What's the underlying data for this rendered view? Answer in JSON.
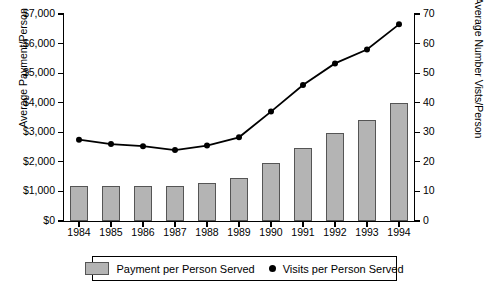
{
  "chart_data": {
    "type": "bar",
    "title": "",
    "xlabel": "",
    "ylabel": "Average Payment/Person",
    "y2label": "Average Number Vists/Person",
    "categories": [
      "1984",
      "1985",
      "1986",
      "1987",
      "1988",
      "1989",
      "1990",
      "1991",
      "1992",
      "1993",
      "1994"
    ],
    "ylim": [
      0,
      7000
    ],
    "y2lim": [
      0,
      70
    ],
    "grid": false,
    "legend_position": "bottom",
    "y_ticklabels": [
      "$0",
      "$1,000",
      "$2,000",
      "$3,000",
      "$4,000",
      "$5,000",
      "$6,000",
      "$7,000"
    ],
    "y_tickvalues": [
      0,
      1000,
      2000,
      3000,
      4000,
      5000,
      6000,
      7000
    ],
    "y2_ticklabels": [
      "0",
      "10",
      "20",
      "30",
      "40",
      "50",
      "60",
      "70"
    ],
    "y2_tickvalues": [
      0,
      10,
      20,
      30,
      40,
      50,
      60,
      70
    ],
    "series": [
      {
        "name": "Payment per Person Served",
        "type": "bar",
        "axis": "left",
        "color": "#b4b4b4",
        "values": [
          1200,
          1200,
          1180,
          1180,
          1270,
          1470,
          1950,
          2470,
          2960,
          3430,
          4000
        ]
      },
      {
        "name": "Visits per Person Served",
        "type": "line",
        "axis": "right",
        "color": "#000000",
        "values": [
          27.5,
          26.0,
          25.3,
          24.0,
          25.5,
          28.3,
          37.0,
          46.0,
          53.3,
          58.0,
          66.5
        ]
      }
    ]
  },
  "legend": {
    "bar_label": "Payment per Person Served",
    "line_label": "Visits per Person Served"
  }
}
